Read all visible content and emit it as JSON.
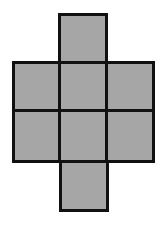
{
  "diagram": {
    "type": "cube-net",
    "colors": {
      "fill": "#a6a6a6",
      "stroke": "#111111",
      "background": "#ffffff"
    },
    "cells": [
      {
        "row": 0,
        "col": 1
      },
      {
        "row": 1,
        "col": 0
      },
      {
        "row": 1,
        "col": 1
      },
      {
        "row": 1,
        "col": 2
      },
      {
        "row": 2,
        "col": 0
      },
      {
        "row": 2,
        "col": 1
      },
      {
        "row": 2,
        "col": 2
      },
      {
        "row": 3,
        "col": 1
      }
    ]
  }
}
